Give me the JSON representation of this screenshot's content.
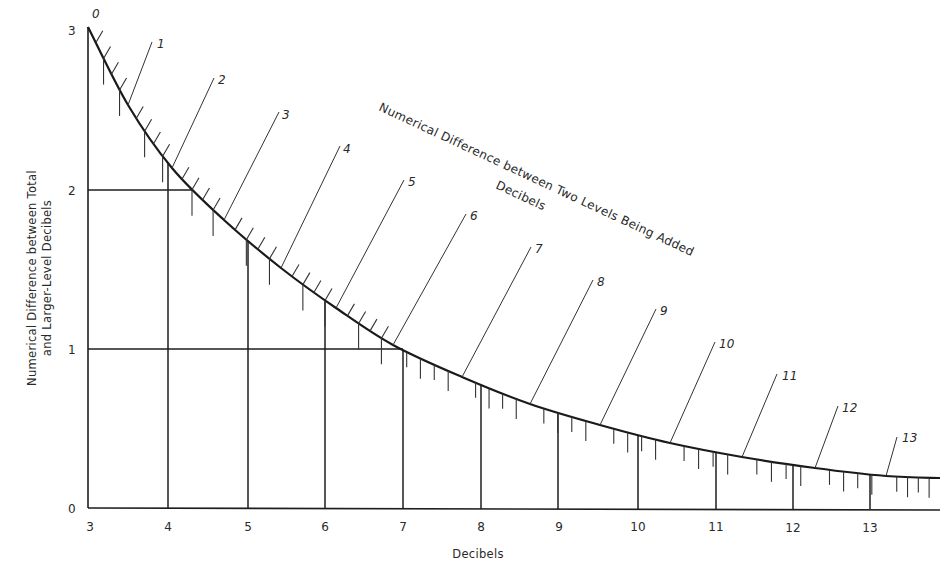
{
  "chart_data": {
    "type": "line",
    "title_line1": "Numerical Difference between Two Levels Being Added",
    "title_line2": "Decibels",
    "xlabel": "Decibels",
    "ylabel_line1": "Numerical Difference between Total",
    "ylabel_line2": "and Larger-Level Decibels",
    "xlim": [
      3,
      13.9
    ],
    "ylim": [
      0,
      3
    ],
    "x_ticks": [
      3,
      4,
      5,
      6,
      7,
      8,
      9,
      10,
      11,
      12,
      13
    ],
    "y_ticks": [
      0,
      1,
      2,
      3
    ],
    "grid": "vertical lines at integer x up to curve; horizontal reference lines at y=1 and y=2",
    "curve_labels": [
      "0",
      "1",
      "2",
      "3",
      "4",
      "5",
      "6",
      "7",
      "8",
      "9",
      "10",
      "11",
      "12",
      "13"
    ],
    "series": [
      {
        "name": "Level difference curve",
        "level_difference_db": [
          0,
          1,
          2,
          3,
          4,
          5,
          6,
          7,
          8,
          9,
          10,
          11,
          12,
          13
        ],
        "increment_db": [
          3.0,
          2.5,
          2.1,
          1.8,
          1.5,
          1.2,
          1.0,
          0.8,
          0.6,
          0.5,
          0.4,
          0.3,
          0.3,
          0.2
        ]
      }
    ],
    "reference_lines": [
      {
        "y": 2,
        "x_end": 4.3
      },
      {
        "y": 1,
        "x_end": 7.0
      }
    ]
  },
  "axes": {
    "x_tick_labels": [
      "3",
      "4",
      "5",
      "6",
      "7",
      "8",
      "9",
      "10",
      "11",
      "12",
      "13"
    ],
    "y_tick_labels": [
      "0",
      "1",
      "2",
      "3"
    ],
    "x_title": "Decibels",
    "y_title_line1": "Numerical Difference between Total",
    "y_title_line2": "and Larger-Level Decibels"
  },
  "diagonal_title": {
    "line1": "Numerical Difference between Two Levels Being Added",
    "line2": "Decibels"
  },
  "curve_labels": [
    "0",
    "1",
    "2",
    "3",
    "4",
    "5",
    "6",
    "7",
    "8",
    "9",
    "10",
    "11",
    "12",
    "13"
  ]
}
